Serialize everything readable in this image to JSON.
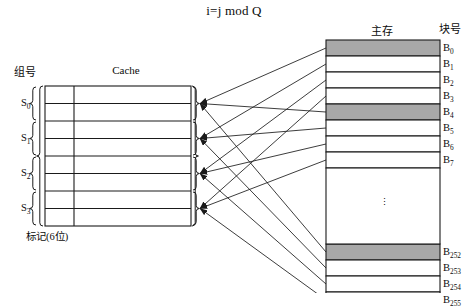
{
  "diagram": {
    "title": "i=j mod Q",
    "type": "set-associative cache mapping diagram",
    "labels": {
      "set_number_header": "组号",
      "cache_header": "Cache",
      "tag_footer": "标记(6位)",
      "main_memory_header": "主存",
      "block_number_header": "块号",
      "vertical_ellipsis": "⋮"
    },
    "colors": {
      "line": "#1a1a1a",
      "shaded_block_fill": "#a8a8a8",
      "block_fill": "#ffffff",
      "background": "#ffffff"
    }
  },
  "cache": {
    "rows": 8,
    "sets": [
      {
        "label": "S",
        "sub": "0"
      },
      {
        "label": "S",
        "sub": "1"
      },
      {
        "label": "S",
        "sub": "2"
      },
      {
        "label": "S",
        "sub": "3"
      }
    ],
    "lines_per_set": 2,
    "columns": [
      "tag",
      "data"
    ]
  },
  "main_memory": {
    "blocks": [
      {
        "label": "B",
        "sub": "0",
        "shaded": true
      },
      {
        "label": "B",
        "sub": "1",
        "shaded": false
      },
      {
        "label": "B",
        "sub": "2",
        "shaded": false
      },
      {
        "label": "B",
        "sub": "3",
        "shaded": false
      },
      {
        "label": "B",
        "sub": "4",
        "shaded": true
      },
      {
        "label": "B",
        "sub": "5",
        "shaded": false
      },
      {
        "label": "B",
        "sub": "6",
        "shaded": false
      },
      {
        "label": "B",
        "sub": "7",
        "shaded": false
      },
      {
        "label": "B",
        "sub": "252",
        "shaded": true
      },
      {
        "label": "B",
        "sub": "253",
        "shaded": false
      },
      {
        "label": "B",
        "sub": "254",
        "shaded": false
      },
      {
        "label": "B",
        "sub": "255",
        "shaded": false
      }
    ]
  }
}
